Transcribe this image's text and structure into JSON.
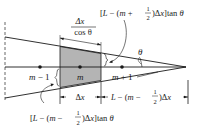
{
  "diagram": {
    "labels": {
      "top_formula": {
        "prefix": "[L − (m + ",
        "frac_num": "1",
        "frac_den": "2",
        "suffix": ")Δx]tan θ"
      },
      "bottom_formula": {
        "prefix": "[L − (m − ",
        "frac_num": "1",
        "frac_den": "2",
        "suffix": ")Δx]tan θ"
      },
      "slant_length": {
        "num": "Δx",
        "den": "cos θ"
      },
      "angle": "θ",
      "node_prev": "m − 1",
      "node_curr": "m",
      "node_next": "m + 1",
      "dim_dx": "Δx",
      "dim_remaining": {
        "prefix": "L − (m − ",
        "frac_num": "1",
        "frac_den": "2",
        "suffix": ")Δx"
      }
    },
    "colors": {
      "line": "#1a1a1a",
      "fill": "#b4b4b4",
      "background": "#ffffff"
    }
  }
}
